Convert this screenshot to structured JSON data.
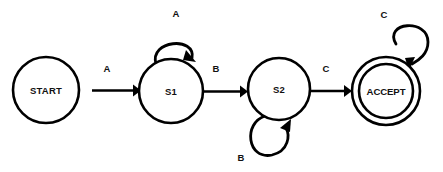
{
  "diagram": {
    "type": "state-transition-diagram",
    "background_color": "#ffffff",
    "stroke_color": "#000000",
    "states": [
      {
        "id": "start",
        "label": "START",
        "shape": "circle",
        "accepting": false,
        "cx": 46,
        "cy": 90,
        "r": 33
      },
      {
        "id": "s1",
        "label": "S1",
        "shape": "circle",
        "accepting": false,
        "cx": 171,
        "cy": 91,
        "r": 32
      },
      {
        "id": "s2",
        "label": "S2",
        "shape": "circle",
        "accepting": false,
        "cx": 279,
        "cy": 89,
        "r": 31
      },
      {
        "id": "accept",
        "label": "ACCEPT",
        "shape": "double-circle",
        "accepting": true,
        "cx": 386,
        "cy": 91,
        "r": 34,
        "r_inner": 27
      }
    ],
    "transitions": [
      {
        "id": "start-to-s1",
        "from": "start",
        "to": "s1",
        "label": "A",
        "kind": "arrow",
        "label_x": 107,
        "label_y": 68
      },
      {
        "id": "s1-to-s2",
        "from": "s1",
        "to": "s2",
        "label": "B",
        "kind": "arrow",
        "label_x": 216,
        "label_y": 68
      },
      {
        "id": "s2-to-accept",
        "from": "s2",
        "to": "accept",
        "label": "C",
        "kind": "arrow",
        "label_x": 326,
        "label_y": 68
      },
      {
        "id": "s1-self-loop",
        "from": "s1",
        "to": "s1",
        "label": "A",
        "kind": "self-loop",
        "position": "top",
        "label_x": 176,
        "label_y": 13
      },
      {
        "id": "s2-self-loop",
        "from": "s2",
        "to": "s2",
        "label": "B",
        "kind": "self-loop",
        "position": "bottom",
        "label_x": 241,
        "label_y": 157
      },
      {
        "id": "accept-self-loop",
        "from": "accept",
        "to": "accept",
        "label": "C",
        "kind": "self-loop",
        "position": "top-right",
        "label_x": 384,
        "label_y": 14
      }
    ]
  }
}
